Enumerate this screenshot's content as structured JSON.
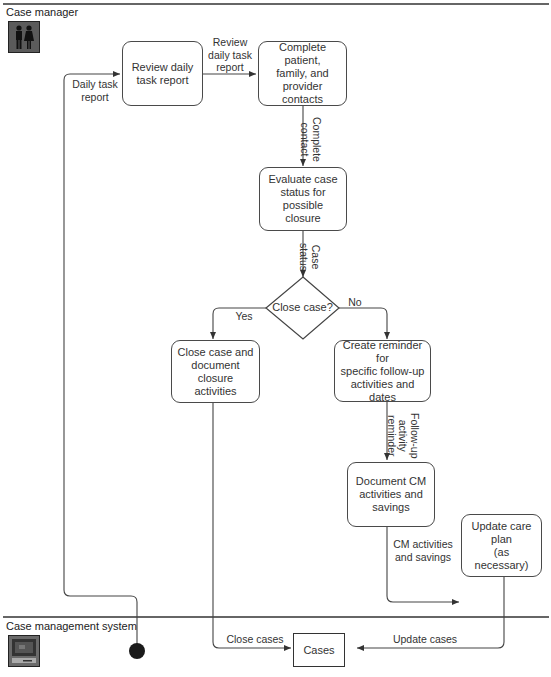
{
  "lanes": [
    {
      "id": "case-manager",
      "label": "Case manager",
      "icon": "people-icon"
    },
    {
      "id": "case-management-system",
      "label": "Case management system",
      "icon": "computer-icon"
    }
  ],
  "nodes": {
    "review": "Review daily\ntask report",
    "contacts": "Complete patient,\nfamily, and\nprovider contacts",
    "evaluate": "Evaluate case\nstatus for\npossible closure",
    "decision": "Close case?",
    "close": "Close case and\ndocument closure\nactivities",
    "reminder": "Create reminder for\nspecific follow-up\nactivities and dates",
    "document": "Document CM\nactivities and\nsavings",
    "update": "Update care plan\n(as necessary)",
    "cases": "Cases"
  },
  "edges": {
    "daily_task_report": "Daily task\nreport",
    "review_daily_task_report": "Review\ndaily task\nreport",
    "complete_contact": "Complete\ncontact",
    "case_status": "Case\nstatus",
    "yes": "Yes",
    "no": "No",
    "follow_up_reminder": "Follow-up\nactivity\nreminder",
    "cm_activities_savings": "CM activities\nand savings",
    "close_cases": "Close cases",
    "update_cases": "Update cases"
  }
}
